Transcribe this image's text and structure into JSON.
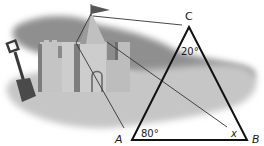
{
  "figure": {
    "vertices": {
      "A": "A",
      "B": "B",
      "C": "C"
    },
    "angles": {
      "A": "80°",
      "B": "x",
      "C": "20°"
    },
    "colors": {
      "sand_light": "#c9c9c9",
      "sand_mid": "#b3b3b3",
      "sand_dark": "#8a8a8a",
      "shadow": "#7a7a7a",
      "triangle_stroke": "#111111",
      "sight_line": "#333333"
    }
  }
}
